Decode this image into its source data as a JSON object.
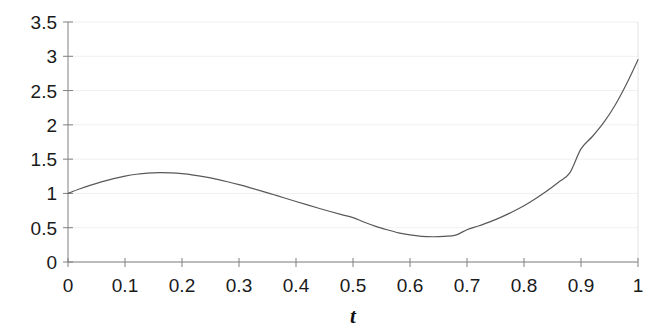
{
  "chart_data": {
    "type": "line",
    "title": "",
    "subtitle": "",
    "xlabel": "t",
    "ylabel": "",
    "xlim": [
      0,
      1
    ],
    "ylim": [
      0,
      3.5
    ],
    "grid": true,
    "grid_axis": "y",
    "legend": null,
    "legend_position": "none",
    "x_ticks": [
      0,
      0.1,
      0.2,
      0.3,
      0.4,
      0.5,
      0.6,
      0.7,
      0.8,
      0.9,
      1
    ],
    "x_tick_labels": [
      "0",
      "0.1",
      "0.2",
      "0.3",
      "0.4",
      "0.5",
      "0.6",
      "0.7",
      "0.8",
      "0.9",
      "1"
    ],
    "y_ticks": [
      0,
      0.5,
      1,
      1.5,
      2,
      2.5,
      3,
      3.5
    ],
    "y_tick_labels": [
      "0",
      "0.5",
      "1",
      "1.5",
      "2",
      "2.5",
      "3",
      "3.5"
    ],
    "series": [
      {
        "name": "curve",
        "color": "#595959",
        "line_width": 1.2,
        "x": [
          0.0,
          0.02,
          0.04,
          0.06,
          0.08,
          0.1,
          0.12,
          0.14,
          0.16,
          0.18,
          0.2,
          0.22,
          0.24,
          0.26,
          0.28,
          0.3,
          0.32,
          0.34,
          0.36,
          0.38,
          0.4,
          0.42,
          0.44,
          0.46,
          0.48,
          0.5,
          0.52,
          0.54,
          0.56,
          0.58,
          0.6,
          0.62,
          0.64,
          0.66,
          0.68,
          0.7,
          0.72,
          0.74,
          0.76,
          0.78,
          0.8,
          0.82,
          0.84,
          0.86,
          0.88,
          0.9,
          0.92,
          0.94,
          0.96,
          0.98,
          1.0
        ],
        "y": [
          1.0,
          1.064,
          1.122,
          1.173,
          1.217,
          1.253,
          1.28,
          1.297,
          1.303,
          1.3,
          1.288,
          1.268,
          1.241,
          1.208,
          1.17,
          1.128,
          1.082,
          1.034,
          0.984,
          0.934,
          0.883,
          0.833,
          0.784,
          0.736,
          0.691,
          0.648,
          0.58,
          0.52,
          0.47,
          0.425,
          0.395,
          0.375,
          0.368,
          0.374,
          0.392,
          0.47,
          0.525,
          0.585,
          0.655,
          0.733,
          0.82,
          0.922,
          1.035,
          1.16,
          1.295,
          1.65,
          1.83,
          2.035,
          2.29,
          2.6,
          2.95
        ]
      }
    ],
    "key_points": {
      "start": {
        "t": 0,
        "value": 1.0
      },
      "local_max": {
        "t": 0.15,
        "value": 1.3
      },
      "local_min": {
        "t": 0.63,
        "value": 0.37
      },
      "end": {
        "t": 1.0,
        "value": 2.95
      }
    },
    "colors": {
      "background": "#ffffff",
      "axis": "#808080",
      "grid": "#f0f0f0",
      "curve": "#595959",
      "text": "#1a1a1a"
    }
  },
  "geometry": {
    "plot_left": 68,
    "plot_right": 638,
    "plot_top": 22,
    "plot_bottom": 262
  }
}
